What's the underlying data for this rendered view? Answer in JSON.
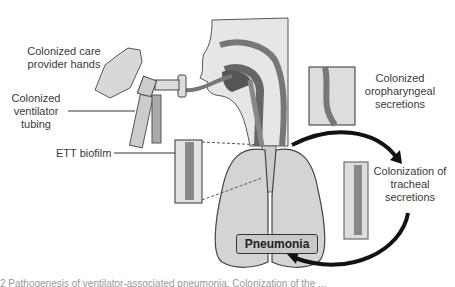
{
  "labels": {
    "hands": "Colonized care provider hands",
    "tubing": "Colonized ventilator tubing",
    "biofilm": "ETT biofilm",
    "oropharyngeal": "Colonized oropharyngeal secretions",
    "tracheal": "Colonization of tracheal secretions",
    "pneumonia": "Pneumonia"
  },
  "caption": "2  Pathogenesis of ventilator-associated pneumonia. Colonization of the ..."
}
